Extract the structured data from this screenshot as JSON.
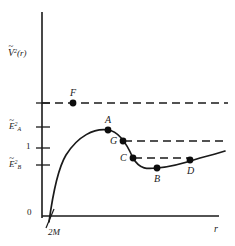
{
  "chart_data": {
    "type": "line",
    "title": "",
    "xlabel": "r",
    "ylabel": "V2(r)",
    "xlim": [
      0,
      235
    ],
    "ylim": [
      0,
      246
    ],
    "grid": false,
    "legend_position": "none",
    "axis": {
      "y_label_main": "V",
      "y_label_exp": "2",
      "y_label_arg": "(r)",
      "x_label": "r",
      "origin_label": "0",
      "horizon_label": "2M"
    },
    "y_ticks": [
      {
        "label_base": "E",
        "label_sup": "2",
        "label_sub": "A",
        "value_name": "E2A",
        "y_px": 127
      },
      {
        "label_base": "1",
        "label_sup": "",
        "label_sub": "",
        "value_name": "one",
        "y_px": 148
      },
      {
        "label_base": "E",
        "label_sup": "2",
        "label_sub": "B",
        "value_name": "E2B",
        "y_px": 165
      }
    ],
    "curve_description": "effective potential V-tilde squared versus r: rises steeply from horizon 2M, peaks at A, falls through G and C to minimum at B, then rises through D",
    "points": [
      {
        "name": "F",
        "label": "F",
        "x_px": 73,
        "y_px": 103,
        "label_dx": -3,
        "label_dy": -13
      },
      {
        "name": "A",
        "label": "A",
        "x_px": 108,
        "y_px": 130,
        "label_dx": -3,
        "label_dy": -13
      },
      {
        "name": "G",
        "label": "G",
        "x_px": 123,
        "y_px": 141,
        "label_dx": -13,
        "label_dy": -1
      },
      {
        "name": "C",
        "label": "C",
        "x_px": 133,
        "y_px": 158,
        "label_dx": -13,
        "label_dy": -1
      },
      {
        "name": "B",
        "label": "B",
        "x_px": 157,
        "y_px": 168,
        "label_dx": -3,
        "label_dy": 12
      },
      {
        "name": "D",
        "label": "D",
        "x_px": 190,
        "y_px": 160,
        "label_dx": -3,
        "label_dy": 12
      }
    ],
    "dashed_levels": [
      {
        "name": "F-level",
        "y_px": 103,
        "x_start": 42,
        "x_end": 228
      },
      {
        "name": "G-level",
        "y_px": 141,
        "x_start": 124,
        "x_end": 228
      },
      {
        "name": "C-level",
        "y_px": 158,
        "x_start": 134,
        "x_end": 191
      }
    ],
    "series": [
      {
        "name": "V-tilde-squared",
        "path": "M 49,222 C 52,200 57,170 66,155 C 78,136 94,128 108,130 C 118,131 126,142 133,158 C 140,170 148,169 157,168 C 172,167 185,163 200,158 C 212,155 219,153 225,151"
      }
    ]
  }
}
